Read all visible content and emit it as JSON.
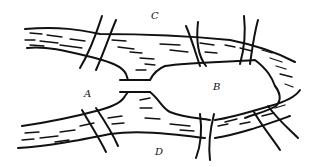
{
  "diagram": {
    "labels": {
      "north_bank": "C",
      "island_west": "A",
      "island_east": "B",
      "south_bank": "D"
    },
    "bridge_count": 7,
    "colors": {
      "ink": "#111111",
      "background": "#ffffff"
    }
  }
}
